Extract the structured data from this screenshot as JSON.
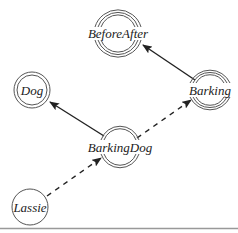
{
  "diagram": {
    "type": "concept-graph",
    "nodes": [
      {
        "id": "BeforeAfter",
        "label": "BeforeAfter",
        "x": 118,
        "y": 33,
        "rings": 3,
        "style": "arcs"
      },
      {
        "id": "Dog",
        "label": "Dog",
        "x": 32,
        "y": 90,
        "rings": 2,
        "style": "full"
      },
      {
        "id": "Barking",
        "label": "Barking",
        "x": 210,
        "y": 90,
        "rings": 3,
        "style": "arcs"
      },
      {
        "id": "BarkingDog",
        "label": "BarkingDog",
        "x": 120,
        "y": 147,
        "rings": 2,
        "style": "arcs"
      },
      {
        "id": "Lassie",
        "label": "Lassie",
        "x": 30,
        "y": 207,
        "rings": 1,
        "style": "full"
      }
    ],
    "edges": [
      {
        "from": "Barking",
        "to": "BeforeAfter",
        "style": "solid"
      },
      {
        "from": "BarkingDog",
        "to": "Dog",
        "style": "solid"
      },
      {
        "from": "BarkingDog",
        "to": "Barking",
        "style": "dashed"
      },
      {
        "from": "Lassie",
        "to": "BarkingDog",
        "style": "dashed"
      }
    ],
    "colors": {
      "edge": "#222222",
      "ring": "#555555",
      "divider": "#999999"
    }
  }
}
